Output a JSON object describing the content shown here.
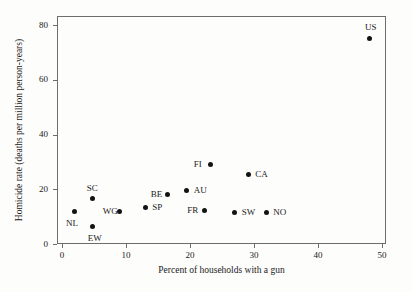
{
  "chart_data": {
    "type": "scatter",
    "title": "",
    "xlabel": "Percent of households with a gun",
    "ylabel": "Homicide rate (deaths per million person-years)",
    "xlim": [
      0,
      52
    ],
    "ylim": [
      0,
      83
    ],
    "xticks": [
      0,
      10,
      20,
      30,
      40,
      50
    ],
    "yticks": [
      0,
      20,
      40,
      60,
      80
    ],
    "xticklabels": [
      "0",
      "10",
      "20",
      "30",
      "40",
      "50"
    ],
    "yticklabels": [
      "0",
      "20",
      "40",
      "60",
      "80"
    ],
    "grid": false,
    "legend": false,
    "marker_color": "#131313",
    "frame_color": "#6d6d6d",
    "points": [
      {
        "label": "NL",
        "x": 2.0,
        "y": 12.0,
        "label_pos": "below-left"
      },
      {
        "label": "EW",
        "x": 4.8,
        "y": 6.5,
        "label_pos": "below"
      },
      {
        "label": "SC",
        "x": 4.8,
        "y": 16.5,
        "label_pos": "above-left"
      },
      {
        "label": "WG",
        "x": 9.0,
        "y": 12.0,
        "label_pos": "left"
      },
      {
        "label": "SP",
        "x": 13.0,
        "y": 13.5,
        "label_pos": "right"
      },
      {
        "label": "BE",
        "x": 16.5,
        "y": 18.0,
        "label_pos": "left"
      },
      {
        "label": "AU",
        "x": 19.5,
        "y": 19.5,
        "label_pos": "right"
      },
      {
        "label": "FR",
        "x": 22.2,
        "y": 12.3,
        "label_pos": "left"
      },
      {
        "label": "FI",
        "x": 23.2,
        "y": 29.0,
        "label_pos": "left"
      },
      {
        "label": "SW",
        "x": 27.0,
        "y": 11.5,
        "label_pos": "right"
      },
      {
        "label": "CA",
        "x": 29.1,
        "y": 25.5,
        "label_pos": "right"
      },
      {
        "label": "NO",
        "x": 31.9,
        "y": 11.5,
        "label_pos": "right"
      },
      {
        "label": "US",
        "x": 48.1,
        "y": 75.2,
        "label_pos": "above"
      }
    ]
  }
}
